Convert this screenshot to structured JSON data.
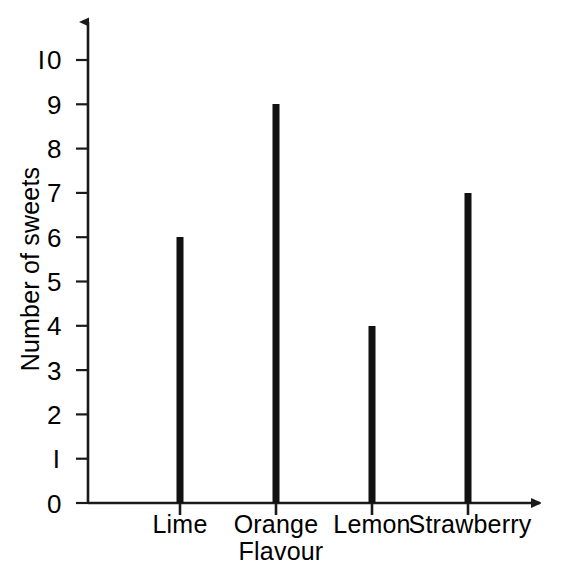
{
  "chart_data": {
    "type": "bar",
    "title": "",
    "subtitle": "",
    "xlabel": "Flavour",
    "ylabel": "Number of sweets",
    "categories": [
      "Lime",
      "Orange",
      "Lemon",
      "Strawberry"
    ],
    "values": [
      6,
      9,
      4,
      7
    ],
    "ylim": [
      0,
      10
    ],
    "y_ticks": [
      "0",
      "1",
      "2",
      "3",
      "4",
      "5",
      "6",
      "7",
      "8",
      "9",
      "10"
    ],
    "grid": false,
    "legend": null,
    "bar_color": "#111111",
    "axis_color": "#1a1a1a",
    "background_color": "#ffffff",
    "axis_style": "arrow-terminated",
    "annotations": []
  }
}
